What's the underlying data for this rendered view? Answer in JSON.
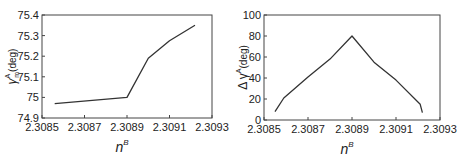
{
  "chart_data": [
    {
      "type": "line",
      "title": "",
      "xlabel": "n",
      "xlabel_sup": "B",
      "ylabel": "γ",
      "ylabel_sub": "m",
      "ylabel_sup": "A",
      "ylabel_unit": "(deg)",
      "xlim": [
        2.3085,
        2.3093
      ],
      "ylim": [
        74.9,
        75.4
      ],
      "xticks": [
        2.3085,
        2.3087,
        2.3089,
        2.3091,
        2.3093
      ],
      "xtick_labels": [
        "2.3085",
        "2.3087",
        "2.3089",
        "2.3091",
        "2.3093"
      ],
      "yticks": [
        74.9,
        75.0,
        75.1,
        75.2,
        75.3,
        75.4
      ],
      "ytick_labels": [
        "74.9",
        "75",
        "75.1",
        "75.2",
        "75.3",
        "75.4"
      ],
      "grid": false,
      "series": [
        {
          "name": "gamma_m_A",
          "x": [
            2.30856,
            2.3089,
            2.309,
            2.3091,
            2.30922
          ],
          "y": [
            74.97,
            75.0,
            75.19,
            75.275,
            75.35
          ]
        }
      ]
    },
    {
      "type": "line",
      "title": "",
      "xlabel": "n",
      "xlabel_sup": "B",
      "ylabel": "Δ γ",
      "ylabel_sup": "A",
      "ylabel_unit": "(deg)",
      "xlim": [
        2.3085,
        2.3093
      ],
      "ylim": [
        0,
        100
      ],
      "xticks": [
        2.3085,
        2.3087,
        2.3089,
        2.3091,
        2.3093
      ],
      "xtick_labels": [
        "2.3085",
        "2.3087",
        "2.3089",
        "2.3091",
        "2.3093"
      ],
      "yticks": [
        0,
        20,
        40,
        60,
        80,
        100
      ],
      "ytick_labels": [
        "0",
        "20",
        "40",
        "60",
        "80",
        "100"
      ],
      "grid": false,
      "series": [
        {
          "name": "delta_gamma_A",
          "x": [
            2.30855,
            2.30859,
            2.3087,
            2.3088,
            2.3089,
            2.309,
            2.3091,
            2.30921,
            2.30922
          ],
          "y": [
            8,
            21,
            41,
            58,
            80,
            55,
            38,
            15,
            7
          ]
        }
      ]
    }
  ]
}
